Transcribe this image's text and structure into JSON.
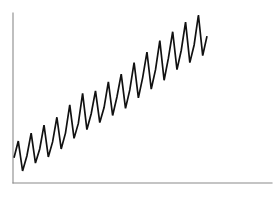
{
  "figure": {
    "title": "",
    "background_color": "#ffffff",
    "width": 278,
    "height": 200
  },
  "axes": {
    "color": "#8a8a8a",
    "line_width": 1.1,
    "y_axis_name": "y-axis",
    "x_axis_name": "x-axis",
    "x_axis_label": "",
    "y_axis_label": "",
    "x_tick_labels": [],
    "y_tick_labels": [],
    "grid": false,
    "spines": {
      "left": true,
      "bottom": true,
      "top": false,
      "right": false
    },
    "plot_left_px": 13,
    "plot_right_px": 272,
    "plot_top_px": 13,
    "plot_bottom_px": 183
  },
  "series_style": {
    "color": "#111111",
    "line_width": 1.7,
    "marker": "none",
    "legend": "none"
  },
  "chart_data": {
    "type": "line",
    "title": "",
    "subtitle": "",
    "xlabel": "",
    "ylabel": "",
    "xlim": [
      0,
      60
    ],
    "ylim": [
      0,
      100
    ],
    "grid": false,
    "legend_position": "none",
    "annotations": [],
    "x": [
      0,
      1,
      2,
      3,
      4,
      5,
      6,
      7,
      8,
      9,
      10,
      11,
      12,
      13,
      14,
      15,
      16,
      17,
      18,
      19,
      20,
      21,
      22,
      23,
      24,
      25,
      26,
      27,
      28,
      29,
      30,
      31,
      32,
      33,
      34,
      35,
      36,
      37,
      38,
      39,
      40,
      41,
      42,
      43,
      44,
      45
    ],
    "series": [
      {
        "name": "value",
        "values": [
          16.5,
          26.0,
          9.0,
          17.5,
          30.5,
          13.5,
          21.5,
          35.0,
          17.0,
          25.5,
          39.5,
          21.5,
          30.5,
          46.5,
          27.5,
          36.0,
          53.0,
          32.5,
          41.5,
          54.5,
          36.5,
          45.0,
          59.5,
          40.5,
          51.0,
          64.0,
          44.5,
          55.0,
          70.5,
          50.5,
          62.0,
          76.5,
          55.5,
          66.5,
          83.0,
          60.5,
          73.0,
          88.0,
          66.5,
          77.5,
          93.5,
          70.5,
          80.5,
          97.5,
          74.5,
          85.5
        ]
      }
    ]
  }
}
